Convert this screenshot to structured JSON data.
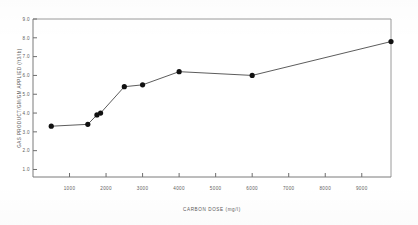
{
  "chart_data": {
    "type": "line",
    "title": "",
    "xlabel": "CARBON DOSE (mg/l)",
    "ylabel": "GAS PRODUCT/GM/GM APPLIED (ft3/lb)",
    "xlim": [
      0,
      9800
    ],
    "ylim": [
      0.6,
      9.0
    ],
    "grid": false,
    "legend_position": "none",
    "x_tick_labels": [
      "1000",
      "2000",
      "3000",
      "4000",
      "5000",
      "6000",
      "7000",
      "8000",
      "9000"
    ],
    "x_ticks": [
      1000,
      2000,
      3000,
      4000,
      5000,
      6000,
      7000,
      8000,
      9000
    ],
    "y_tick_labels": [
      "1.0",
      "2.0",
      "3.0",
      "4.0",
      "5.0",
      "6.0",
      "7.0",
      "8.0",
      "9.0"
    ],
    "y_ticks": [
      1.0,
      2.0,
      3.0,
      4.0,
      5.0,
      6.0,
      7.0,
      8.0,
      9.0
    ],
    "series": [
      {
        "name": "gas production",
        "marker": "filled-circle",
        "color": "#111111",
        "x": [
          500,
          1500,
          1750,
          1850,
          2500,
          3000,
          4000,
          6000,
          9800
        ],
        "y": [
          3.3,
          3.4,
          3.9,
          4.0,
          5.4,
          5.5,
          6.2,
          6.0,
          7.8
        ]
      }
    ]
  },
  "figure": {
    "axis_title_x": "CARBON DOSE (mg/l)",
    "axis_title_y": "GAS PRODUCT/GM/GM APPLIED (ft3/lb)"
  }
}
